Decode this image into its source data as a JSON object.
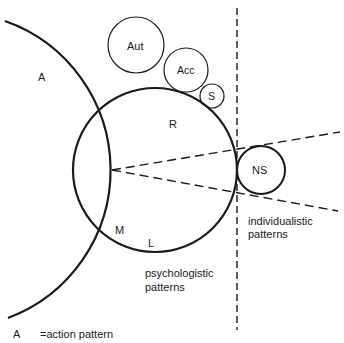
{
  "diagram": {
    "regions": {
      "A": "A",
      "R": "R",
      "M": "M",
      "L": "L"
    },
    "circles": {
      "aut": "Aut",
      "acc": "Acc",
      "s": "S",
      "ns": "NS"
    },
    "captions": {
      "individualistic_line1": "individualistic",
      "individualistic_line2": "patterns",
      "psychologistic_line1": "psychologistic",
      "psychologistic_line2": "patterns"
    },
    "legend": {
      "key": "A",
      "definition": "=action pattern"
    },
    "colors": {
      "stroke": "#1a1a1a",
      "background": "#ffffff"
    }
  }
}
